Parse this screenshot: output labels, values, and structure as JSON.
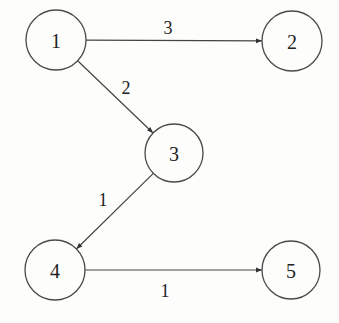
{
  "diagram": {
    "type": "directed-weighted-graph",
    "nodes": [
      {
        "id": "1",
        "label": "1",
        "cx": 56,
        "cy": 40,
        "r": 30
      },
      {
        "id": "2",
        "label": "2",
        "cx": 292,
        "cy": 41,
        "r": 30
      },
      {
        "id": "3",
        "label": "3",
        "cx": 174,
        "cy": 153,
        "r": 29
      },
      {
        "id": "4",
        "label": "4",
        "cx": 55,
        "cy": 270,
        "r": 30
      },
      {
        "id": "5",
        "label": "5",
        "cx": 291,
        "cy": 270,
        "r": 29
      }
    ],
    "edges": [
      {
        "from": "1",
        "to": "2",
        "weight": "3",
        "label_x": 168,
        "label_y": 28
      },
      {
        "from": "1",
        "to": "3",
        "weight": "2",
        "label_x": 126,
        "label_y": 88
      },
      {
        "from": "3",
        "to": "4",
        "weight": "1",
        "label_x": 103,
        "label_y": 200
      },
      {
        "from": "4",
        "to": "5",
        "weight": "1",
        "label_x": 165,
        "label_y": 291
      }
    ]
  }
}
